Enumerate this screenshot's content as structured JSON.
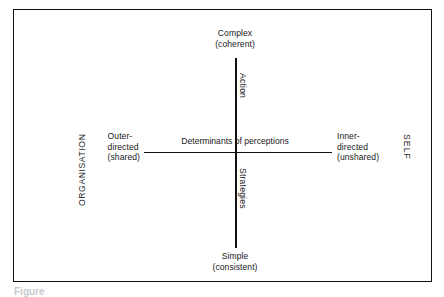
{
  "figure": {
    "kind": "two-axis-matrix",
    "frame_border_color": "#111111",
    "axis_color": "#111111",
    "background": "#ffffff",
    "centre_label": "Determinants of perceptions",
    "vertical_axis": {
      "name": "Action",
      "lower_name": "Strategies",
      "top_label_line1": "Complex",
      "top_label_line2": "(coherent)",
      "bottom_label_line1": "Simple",
      "bottom_label_line2": "(consistent)"
    },
    "horizontal_axis": {
      "left_label_line1": "Outer-",
      "left_label_line2": "directed",
      "left_label_line3": "(shared)",
      "right_label_line1": "Inner-",
      "right_label_line2": "directed",
      "right_label_line3": "(unshared)"
    },
    "side_labels": {
      "left": "ORGANISATION",
      "right": "SELF"
    },
    "caption": "Figure"
  }
}
